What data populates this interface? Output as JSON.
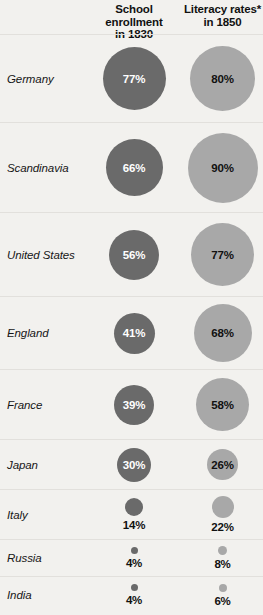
{
  "header": {
    "label_col": "",
    "enrollment_line1": "School enrollment",
    "enrollment_line2": "in 1830",
    "literacy_line1": "Literacy rates*",
    "literacy_line2": "in 1850"
  },
  "colors": {
    "background": "#f2f1ee",
    "enrollment_bubble": "#6a6a6a",
    "literacy_bubble": "#a8a8a8",
    "divider": "#e2e0dc",
    "text_dark": "#111111",
    "text_light": "#ffffff"
  },
  "rows": [
    {
      "label": "Germany",
      "enrollment": {
        "value": "77%",
        "pct": 77,
        "size": 63,
        "label_inside": true,
        "text_color": "#ffffff"
      },
      "literacy": {
        "value": "80%",
        "pct": 80,
        "size": 65,
        "label_inside": true,
        "text_color": "#111111"
      },
      "height": 88
    },
    {
      "label": "Scandinavia",
      "enrollment": {
        "value": "66%",
        "pct": 66,
        "size": 57,
        "label_inside": true,
        "text_color": "#ffffff"
      },
      "literacy": {
        "value": "90%",
        "pct": 90,
        "size": 70,
        "label_inside": true,
        "text_color": "#111111"
      },
      "height": 90
    },
    {
      "label": "United States",
      "enrollment": {
        "value": "56%",
        "pct": 56,
        "size": 50,
        "label_inside": true,
        "text_color": "#ffffff"
      },
      "literacy": {
        "value": "77%",
        "pct": 77,
        "size": 63,
        "label_inside": true,
        "text_color": "#111111"
      },
      "height": 84
    },
    {
      "label": "England",
      "enrollment": {
        "value": "41%",
        "pct": 41,
        "size": 41,
        "label_inside": true,
        "text_color": "#ffffff"
      },
      "literacy": {
        "value": "68%",
        "pct": 68,
        "size": 58,
        "label_inside": true,
        "text_color": "#111111"
      },
      "height": 73
    },
    {
      "label": "France",
      "enrollment": {
        "value": "39%",
        "pct": 39,
        "size": 40,
        "label_inside": true,
        "text_color": "#ffffff"
      },
      "literacy": {
        "value": "58%",
        "pct": 58,
        "size": 53,
        "label_inside": true,
        "text_color": "#111111"
      },
      "height": 70
    },
    {
      "label": "Japan",
      "enrollment": {
        "value": "30%",
        "pct": 30,
        "size": 34,
        "label_inside": true,
        "text_color": "#ffffff"
      },
      "literacy": {
        "value": "26%",
        "pct": 26,
        "size": 31,
        "label_inside": true,
        "text_color": "#111111"
      },
      "height": 50
    },
    {
      "label": "Italy",
      "enrollment": {
        "value": "14%",
        "pct": 14,
        "size": 18,
        "label_inside": false,
        "text_color": "#111111"
      },
      "literacy": {
        "value": "22%",
        "pct": 22,
        "size": 22,
        "label_inside": false,
        "text_color": "#111111"
      },
      "height": 50
    },
    {
      "label": "Russia",
      "enrollment": {
        "value": "4%",
        "pct": 4,
        "size": 7,
        "label_inside": false,
        "text_color": "#111111"
      },
      "literacy": {
        "value": "8%",
        "pct": 8,
        "size": 9,
        "label_inside": false,
        "text_color": "#111111"
      },
      "height": 37
    },
    {
      "label": "India",
      "enrollment": {
        "value": "4%",
        "pct": 4,
        "size": 7,
        "label_inside": false,
        "text_color": "#111111"
      },
      "literacy": {
        "value": "6%",
        "pct": 6,
        "size": 8,
        "label_inside": false,
        "text_color": "#111111"
      },
      "height": 37
    }
  ],
  "chart_data": {
    "type": "bubble",
    "title": "",
    "categories": [
      "Germany",
      "Scandinavia",
      "United States",
      "England",
      "France",
      "Japan",
      "Italy",
      "Russia",
      "India"
    ],
    "series": [
      {
        "name": "School enrollment in 1830",
        "values": [
          77,
          66,
          56,
          41,
          39,
          30,
          14,
          4,
          4
        ],
        "unit": "%",
        "color": "#6a6a6a"
      },
      {
        "name": "Literacy rates* in 1850",
        "values": [
          80,
          90,
          77,
          68,
          58,
          26,
          22,
          8,
          6
        ],
        "unit": "%",
        "color": "#a8a8a8"
      }
    ],
    "xlabel": "",
    "ylabel": "",
    "legend": [
      "School enrollment in 1830",
      "Literacy rates* in 1850"
    ],
    "legend_position": "top",
    "grid": false,
    "note": "Bubble area encodes percentage value; asterisk on 'Literacy rates*' marks a footnote."
  }
}
